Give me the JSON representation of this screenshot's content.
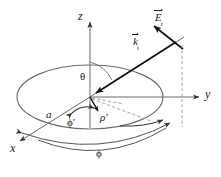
{
  "figure": {
    "background_color": "#ffffff",
    "stroke_color": "#555555",
    "vector_color": "#111111",
    "text_color": "#1a1a1a",
    "dashed_color": "#999999",
    "width": 221,
    "height": 177
  },
  "axes": [
    {
      "name": "z-axis",
      "label": "z",
      "direction": "up",
      "tip": [
        90,
        20
      ],
      "origin": [
        90,
        97
      ]
    },
    {
      "name": "y-axis",
      "label": "y",
      "direction": "right",
      "tip": [
        200,
        97
      ],
      "origin": [
        90,
        97
      ]
    },
    {
      "name": "x-axis",
      "label": "x",
      "direction": "down-left",
      "tip": [
        18,
        143
      ],
      "origin": [
        90,
        97
      ]
    }
  ],
  "labels": {
    "z": "z",
    "y": "y",
    "x": "x",
    "theta": "θ",
    "radius_a": "a",
    "phi_prime": "ϕ′",
    "rho_prime": "ρ′",
    "phi": "ϕ",
    "E_field": "E",
    "E_sub": "i",
    "k_vector": "k",
    "k_sub": "i"
  },
  "disk": {
    "name": "circular-disk",
    "center": [
      90,
      97
    ],
    "rx": 73,
    "ry": 32,
    "radius_label": "a"
  },
  "angles": [
    {
      "name": "theta",
      "symbol": "θ",
      "description": "polar angle from z-axis to incident wave vector"
    },
    {
      "name": "phi-prime",
      "symbol": "ϕ′",
      "description": "azimuthal source-point angle in disk plane"
    },
    {
      "name": "phi",
      "symbol": "ϕ",
      "description": "azimuthal observation angle measured from x-axis"
    }
  ],
  "vectors": [
    {
      "name": "incident-wave-vector",
      "symbol": "k",
      "subscript": "i",
      "arrow_from": [
        175,
        42
      ],
      "arrow_to": [
        93,
        94
      ]
    },
    {
      "name": "incident-electric-field",
      "symbol": "E",
      "subscript": "i",
      "arrow_from": [
        182,
        48
      ],
      "arrow_to": [
        152,
        24
      ]
    },
    {
      "name": "rho-prime-vector",
      "symbol": "ρ′",
      "arrow_from": [
        90,
        97
      ],
      "arrow_to": [
        99,
        112
      ]
    }
  ],
  "dashed_guides": [
    {
      "name": "vertical-projection-line",
      "from": [
        182,
        48
      ],
      "to": [
        182,
        124
      ]
    },
    {
      "name": "radial-projection-line",
      "from": [
        90,
        97
      ],
      "to": [
        160,
        124
      ]
    }
  ]
}
